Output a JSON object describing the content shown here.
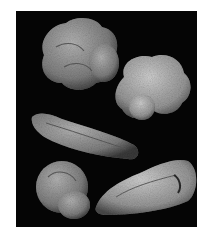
{
  "figure": {
    "background": "#050505",
    "specimen_count": 5,
    "specimens": [
      {
        "id": "top-left",
        "shape": "lobed-trochospiral",
        "tone": "#8a8a8a"
      },
      {
        "id": "top-right",
        "shape": "spinose-globular",
        "tone": "#a0a0a0"
      },
      {
        "id": "middle",
        "shape": "elongate-biserial",
        "tone": "#8c8c8c"
      },
      {
        "id": "bottom-left",
        "shape": "planispiral",
        "tone": "#8f8f8f"
      },
      {
        "id": "bottom-right",
        "shape": "elongate-trochospiral",
        "tone": "#929292"
      }
    ]
  }
}
